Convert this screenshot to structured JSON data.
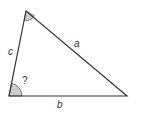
{
  "diagram": {
    "type": "triangle",
    "vertices": {
      "top": [
        26,
        11
      ],
      "bottom_left": [
        9,
        96
      ],
      "bottom_right": [
        127,
        96
      ]
    },
    "sides": {
      "a": "a",
      "b": "b",
      "c": "c"
    },
    "unknown_angle_label": "?",
    "colors": {
      "stroke": "#333333",
      "angle_fill": "#cccccc"
    }
  }
}
